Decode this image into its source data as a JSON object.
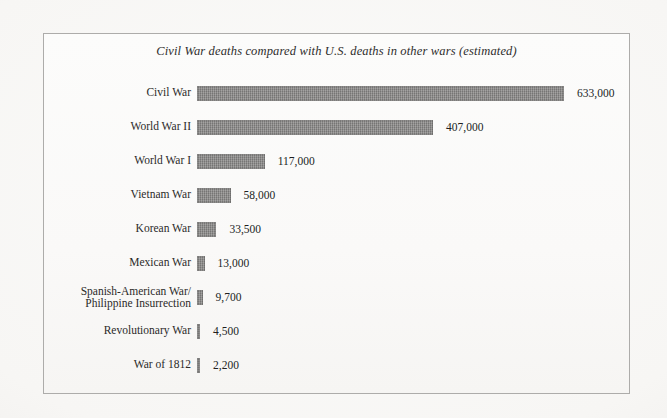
{
  "chart_data": {
    "type": "bar",
    "orientation": "horizontal",
    "title": "Civil War deaths compared with U.S. deaths in other wars (estimated)",
    "xlabel": "",
    "ylabel": "",
    "grid": false,
    "legend": "none",
    "axis_visible": false,
    "xlim": [
      0,
      633000
    ],
    "categories": [
      "Civil War",
      "World War II",
      "World War I",
      "Vietnam War",
      "Korean War",
      "Mexican War",
      "Spanish-American War/\nPhilippine Insurrection",
      "Revolutionary War",
      "War of 1812"
    ],
    "values": [
      633000,
      407000,
      117000,
      58000,
      33500,
      13000,
      9700,
      4500,
      2200
    ],
    "value_labels": [
      "633,000",
      "407,000",
      "117,000",
      "58,000",
      "33,500",
      "13,000",
      "9,700",
      "4,500",
      "2,200"
    ],
    "bar_color": "#848382"
  },
  "figure": {
    "border_color": "#adacaa",
    "background_color": "#faf9f8"
  }
}
